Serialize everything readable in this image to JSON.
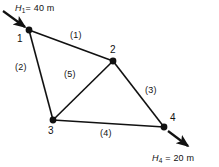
{
  "figure": {
    "type": "node-link-network-diagram",
    "background_color": "#ffffff",
    "line_color": "#111111",
    "width": 219,
    "height": 167
  },
  "nodes": [
    {
      "id": "1",
      "label": "1",
      "x": 29,
      "y": 30,
      "label_x": 17,
      "label_y": 34
    },
    {
      "id": "2",
      "label": "2",
      "x": 113,
      "y": 61,
      "label_x": 110,
      "label_y": 45
    },
    {
      "id": "3",
      "label": "3",
      "x": 53,
      "y": 120,
      "label_x": 48,
      "label_y": 126
    },
    {
      "id": "4",
      "label": "4",
      "x": 164,
      "y": 127,
      "label_x": 170,
      "label_y": 113
    }
  ],
  "edges": [
    {
      "id": "1",
      "label": "(1)",
      "from": "1",
      "to": "2",
      "label_x": 70,
      "label_y": 31
    },
    {
      "id": "2",
      "label": "(2)",
      "from": "1",
      "to": "3",
      "label_x": 15,
      "label_y": 63
    },
    {
      "id": "3",
      "label": "(3)",
      "from": "2",
      "to": "4",
      "label_x": 145,
      "label_y": 86
    },
    {
      "id": "4",
      "label": "(4)",
      "from": "3",
      "to": "4",
      "label_x": 100,
      "label_y": 129
    },
    {
      "id": "5",
      "label": "(5)",
      "from": "3",
      "to": "2",
      "label_x": 64,
      "label_y": 70
    }
  ],
  "boundary_conditions": [
    {
      "id": "inlet",
      "symbol": "H",
      "subscript": "1",
      "equals": "=",
      "value": "40",
      "unit": "m",
      "full_text": "H1 = 40 m",
      "label_x": 15,
      "label_y": 4,
      "arrow": {
        "x1": 3,
        "y1": 11,
        "x2": 26,
        "y2": 28
      }
    },
    {
      "id": "outlet",
      "symbol": "H",
      "subscript": "4",
      "equals": "=",
      "value": "20",
      "unit": "m",
      "full_text": "H4 = 20 m",
      "label_x": 152,
      "label_y": 154,
      "arrow": {
        "x1": 167,
        "y1": 130,
        "x2": 190,
        "y2": 148
      }
    }
  ]
}
